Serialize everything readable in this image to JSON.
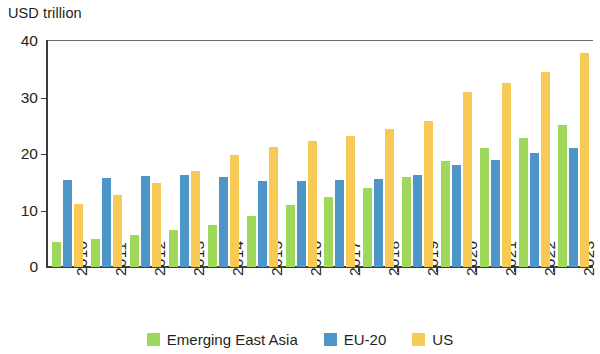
{
  "chart_data": {
    "type": "bar",
    "title": "",
    "ylabel": "USD trillion",
    "xlabel": "",
    "ylim": [
      0,
      40
    ],
    "yticks": [
      0,
      10,
      20,
      30,
      40
    ],
    "ytick_labels": [
      "0",
      "10",
      "20",
      "30",
      "40"
    ],
    "grid": false,
    "legend_position": "bottom",
    "categories": [
      "2010",
      "2011",
      "2012",
      "2013",
      "2014",
      "2015",
      "2016",
      "2017",
      "2018",
      "2019",
      "2020",
      "2021",
      "2022",
      "2023"
    ],
    "series": [
      {
        "name": "Emerging East Asia",
        "color": "#9ed95b",
        "values": [
          4.5,
          4.9,
          5.6,
          6.5,
          7.4,
          9.1,
          10.9,
          12.4,
          13.9,
          15.9,
          18.7,
          21.0,
          22.8,
          25.1
        ]
      },
      {
        "name": "EU-20",
        "color": "#4e95c8",
        "values": [
          15.4,
          15.8,
          16.1,
          16.2,
          16.0,
          15.2,
          15.2,
          15.4,
          15.5,
          16.3,
          18.1,
          19.0,
          20.2,
          21.1
        ]
      },
      {
        "name": "US",
        "color": "#f7c955",
        "values": [
          11.1,
          12.8,
          14.9,
          17.0,
          19.9,
          21.3,
          22.3,
          23.2,
          24.5,
          25.9,
          30.9,
          32.5,
          34.6,
          37.9
        ]
      }
    ]
  },
  "axis": {
    "unit_title": "USD trillion"
  },
  "legend": {
    "items": [
      {
        "label": "Emerging East Asia",
        "color": "#9ed95b"
      },
      {
        "label": "EU-20",
        "color": "#4e95c8"
      },
      {
        "label": "US",
        "color": "#f7c955"
      }
    ]
  },
  "style": {
    "axis_color": "#3b3b3b",
    "text_color": "#231f20",
    "background": "#ffffff"
  }
}
